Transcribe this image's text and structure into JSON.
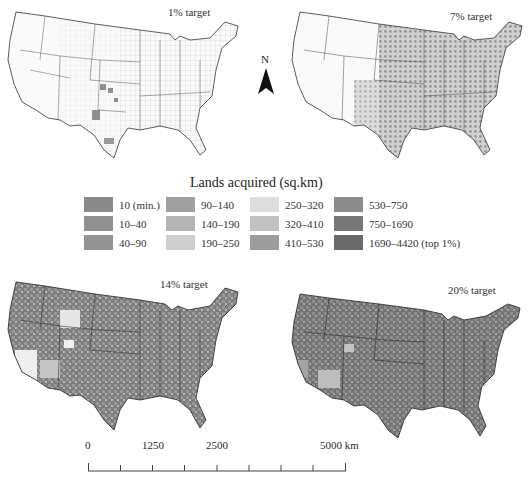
{
  "figure": {
    "north_arrow_label": "N",
    "panels": [
      {
        "id": "p1",
        "title": "1% target",
        "intensity": 0.05
      },
      {
        "id": "p7",
        "title": "7% target",
        "intensity": 0.45
      },
      {
        "id": "p14",
        "title": "14% target",
        "intensity": 0.8
      },
      {
        "id": "p20",
        "title": "20% target",
        "intensity": 0.92
      }
    ]
  },
  "legend": {
    "title": "Lands acquired (sq.km)",
    "items": [
      {
        "label": "10 (min.)",
        "color": "#8a8a8a"
      },
      {
        "label": "10–40",
        "color": "#909090"
      },
      {
        "label": "40–90",
        "color": "#939393"
      },
      {
        "label": "90–140",
        "color": "#a0a0a0"
      },
      {
        "label": "140–190",
        "color": "#b4b4b4"
      },
      {
        "label": "190–250",
        "color": "#cfcfcf"
      },
      {
        "label": "250–320",
        "color": "#dddddd"
      },
      {
        "label": "320–410",
        "color": "#c2c2c2"
      },
      {
        "label": "410–530",
        "color": "#9c9c9c"
      },
      {
        "label": "530–750",
        "color": "#8c8c8c"
      },
      {
        "label": "750–1690",
        "color": "#777777"
      },
      {
        "label": "1690–4420 (top 1%)",
        "color": "#6a6a6a"
      }
    ]
  },
  "scale_bar": {
    "labels": [
      "0",
      "1250",
      "2500",
      "5000 km"
    ]
  }
}
